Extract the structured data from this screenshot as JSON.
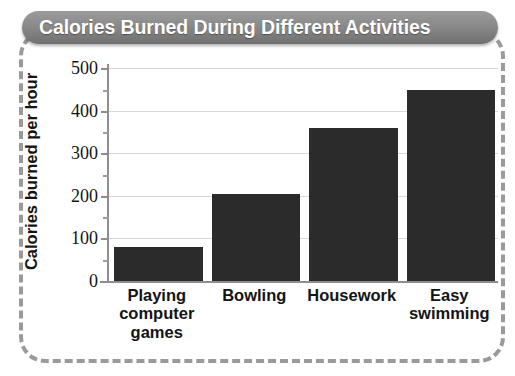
{
  "title": "Calories Burned During Different Activities",
  "axis": {
    "y_title": "Calories burned per hour",
    "y_ticks": [
      "0",
      "100",
      "200",
      "300",
      "400",
      "500"
    ]
  },
  "colors": {
    "bar": "#2b2b2b",
    "banner": "#8a8a8a",
    "banner_text": "#ffffff",
    "gridline": "#d8d8d8",
    "axis": "#8e8e8e",
    "frame_dash": "#9a9a9a"
  },
  "chart_data": {
    "type": "bar",
    "title": "Calories Burned During Different Activities",
    "xlabel": "",
    "ylabel": "Calories burned per hour",
    "categories": [
      "Playing computer games",
      "Bowling",
      "Housework",
      "Easy swimming"
    ],
    "category_lines": [
      [
        "Playing",
        "computer",
        "games"
      ],
      [
        "Bowling"
      ],
      [
        "Housework"
      ],
      [
        "Easy",
        "swimming"
      ]
    ],
    "values": [
      80,
      205,
      360,
      450
    ],
    "ylim": [
      0,
      510
    ],
    "ytick_values": [
      0,
      100,
      200,
      300,
      400,
      500
    ],
    "minor_tick_interval": 50,
    "grid": true,
    "grid_axis": "y",
    "legend": false
  }
}
